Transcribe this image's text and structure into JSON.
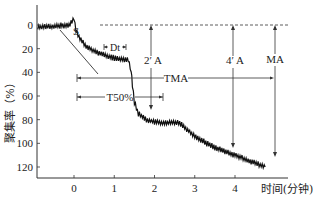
{
  "chart_data": {
    "type": "line",
    "title": "",
    "xlabel": "时间(分钟)",
    "ylabel": "聚集率（%）",
    "x_ticks": [
      "0",
      "1",
      "2",
      "3",
      "4"
    ],
    "y_ticks": [
      "0",
      "20",
      "40",
      "60",
      "80",
      "100",
      "120"
    ],
    "xlim": [
      -0.95,
      4.8
    ],
    "ylim": [
      0,
      130
    ],
    "y_inverted": true,
    "grid": false,
    "legend": null,
    "series": [
      {
        "name": "aggregation",
        "x": [
          -0.9,
          -0.5,
          -0.1,
          0.0,
          0.05,
          0.15,
          0.3,
          0.5,
          0.8,
          1.0,
          1.2,
          1.35,
          1.42,
          1.45,
          1.5,
          1.6,
          1.8,
          2.0,
          2.3,
          2.6,
          2.8,
          3.0,
          3.3,
          3.6,
          4.0,
          4.3,
          4.6,
          4.75
        ],
        "values": [
          2,
          1,
          0,
          -6,
          5,
          12,
          18,
          22,
          26,
          28,
          29,
          30,
          38,
          50,
          65,
          75,
          80,
          82,
          83,
          82,
          88,
          94,
          100,
          105,
          110,
          114,
          118,
          120
        ]
      }
    ],
    "annotations": [
      {
        "text": "S",
        "description": "slope tangent line at initial aggregation"
      },
      {
        "text": "Dt",
        "description": "delay time bracket near x≈0.3–0.8"
      },
      {
        "text": "2′ A",
        "x": 2,
        "description": "arrow from 0 to aggregation at 2 min"
      },
      {
        "text": "4′ A",
        "x": 4,
        "description": "arrow from 0 to aggregation at 4 min"
      },
      {
        "text": "MA",
        "x": 4.6,
        "description": "maximum aggregation arrow"
      },
      {
        "text": "TMA",
        "description": "time to maximum aggregation, horizontal arrow from 0 to ~4.6"
      },
      {
        "text": "T50%",
        "description": "time to 50% aggregation, horizontal arrow from 0 to ~2.05"
      }
    ],
    "reference_line": {
      "y": 0,
      "style": "dashed"
    }
  }
}
